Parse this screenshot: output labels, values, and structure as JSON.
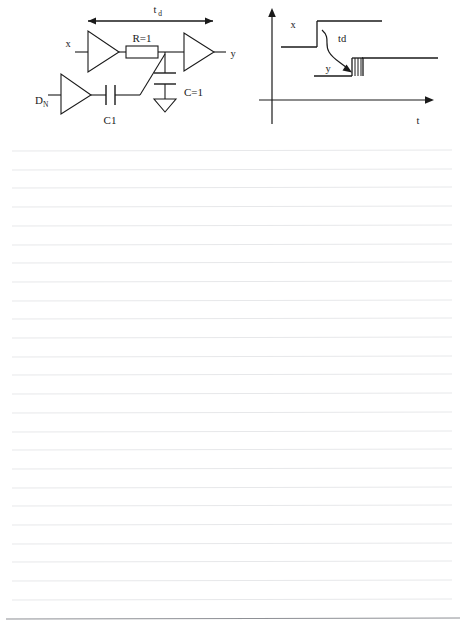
{
  "page": {
    "width": 465,
    "height": 641,
    "background_color": "#ffffff",
    "rule_line_color": "#e7e8ea",
    "bottom_rule_color": "#8e9095",
    "ink_color": "#1a1a1a",
    "rule_line_count": 26,
    "rule_first_y": 150,
    "rule_spacing": 18.7,
    "rule_left_x": 12,
    "rule_right_x": 452
  },
  "figure": {
    "circuit": {
      "name": "buffer-delay-circuit",
      "labels": {
        "delay_span": "t",
        "delay_span_sub": "d",
        "input": "x",
        "output": "y",
        "noise_input": "D",
        "noise_input_sub": "N",
        "resistor": "R=1",
        "capacitor_ground": "C=1",
        "capacitor_coupling": "C1"
      },
      "components": [
        {
          "type": "buffer",
          "name": "input-buffer"
        },
        {
          "type": "resistor",
          "name": "resistor-r1",
          "value": "R=1"
        },
        {
          "type": "buffer",
          "name": "output-buffer"
        },
        {
          "type": "capacitor",
          "name": "capacitor-c1",
          "value": "C=1"
        },
        {
          "type": "buffer",
          "name": "noise-buffer"
        },
        {
          "type": "capacitor",
          "name": "coupling-capacitor-c1",
          "value": "C1"
        },
        {
          "type": "ground",
          "name": "ground-symbol"
        },
        {
          "type": "arrow",
          "name": "delay-span-arrow"
        }
      ]
    },
    "timing": {
      "name": "timing-diagram",
      "labels": {
        "x_signal": "x",
        "y_signal": "y",
        "delay": "td",
        "time_axis": "t"
      },
      "waveforms": [
        {
          "name": "x-waveform",
          "low_level": 47,
          "high_level": 22,
          "edge_x": 317
        },
        {
          "name": "y-waveform",
          "low_level": 76,
          "high_level": 58,
          "edge_x": 352,
          "jitter_width": 11,
          "jitter_lines": 4
        }
      ],
      "axes": {
        "vertical": "value",
        "horizontal": "t"
      }
    }
  }
}
